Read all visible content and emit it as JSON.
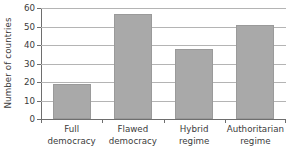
{
  "chart_data": {
    "type": "bar",
    "title": "",
    "xlabel": "",
    "ylabel": "Number of countries",
    "categories": [
      "Full democracy",
      "Flawed democracy",
      "Hybrid regime",
      "Authoritarian regime"
    ],
    "category_lines": [
      [
        "Full",
        "democracy"
      ],
      [
        "Flawed",
        "democracy"
      ],
      [
        "Hybrid",
        "regime"
      ],
      [
        "Authoritarian",
        "regime"
      ]
    ],
    "values": [
      19,
      57,
      38,
      51
    ],
    "ylim": [
      0,
      60
    ],
    "yticks": [
      0,
      10,
      20,
      30,
      40,
      50,
      60
    ],
    "ytick_labels": [
      "0",
      "10",
      "20",
      "30",
      "40",
      "50",
      "60"
    ],
    "grid": true,
    "legend": "none",
    "bar_color": "#a9a9a9",
    "bar_edge_color": "#9a9a9a",
    "axis_color": "#6e6e6e",
    "gridline_color": "#b4b4b4",
    "text_color": "#3b3b3b",
    "background": "#ffffff"
  }
}
